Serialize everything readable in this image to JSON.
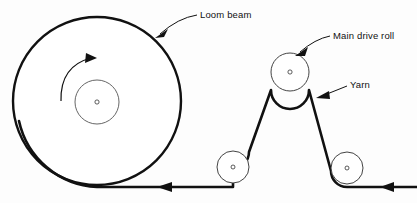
{
  "diagram": {
    "background_color": "#fdfdfd",
    "line_color": "#111111",
    "labels": {
      "loom_beam": "Loom beam",
      "main_drive_roll": "Main drive roll",
      "yarn": "Yarn"
    },
    "components": {
      "loom_beam": {
        "name": "loom-beam",
        "center_x": 97,
        "center_y": 101,
        "radius": 84,
        "hub_radius": 22,
        "rotation_direction": "clockwise"
      },
      "main_drive_roll": {
        "name": "main-drive-roll",
        "center_x": 290,
        "center_y": 72,
        "radius": 19
      },
      "left_guide_roll": {
        "name": "left-guide-roll",
        "center_x": 233,
        "center_y": 167,
        "radius": 16
      },
      "right_guide_roll": {
        "name": "right-guide-roll",
        "center_x": 347,
        "center_y": 168,
        "radius": 16
      }
    },
    "yarn_direction_arrows": [
      {
        "name": "yarn-arrow-middle",
        "x": 164,
        "y": 187,
        "points": "left"
      },
      {
        "name": "yarn-arrow-right",
        "x": 387,
        "y": 187,
        "points": "left"
      }
    ]
  }
}
